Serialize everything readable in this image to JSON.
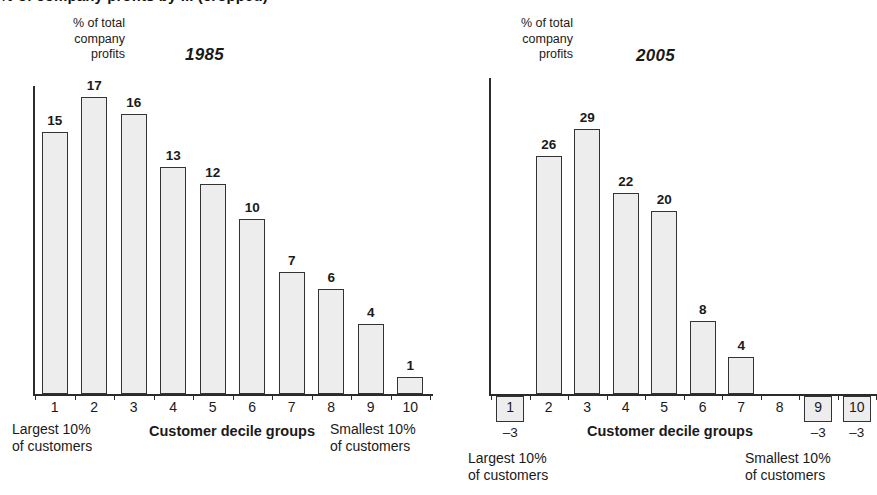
{
  "headline": "% of company profits by ... (cropped)",
  "charts": [
    {
      "id": "1985",
      "title": "1985",
      "y_caption_line1": "% of total",
      "y_caption_line2": "company",
      "y_caption_line3": "profits",
      "x_axis_title": "Customer decile groups",
      "left_note_line1": "Largest 10%",
      "left_note_line2": "of customers",
      "right_note_line1": "Smallest 10%",
      "right_note_line2": "of customers",
      "categories": [
        "1",
        "2",
        "3",
        "4",
        "5",
        "6",
        "7",
        "8",
        "9",
        "10"
      ],
      "values": [
        15,
        17,
        16,
        13,
        12,
        10,
        7,
        6,
        4,
        1
      ],
      "value_labels": [
        "15",
        "17",
        "16",
        "13",
        "12",
        "10",
        "7",
        "6",
        "4",
        "1"
      ]
    },
    {
      "id": "2005",
      "title": "2005",
      "y_caption_line1": "% of total",
      "y_caption_line2": "company",
      "y_caption_line3": "profits",
      "x_axis_title": "Customer decile groups",
      "left_note_line1": "Largest 10%",
      "left_note_line2": "of customers",
      "right_note_line1": "Smallest 10%",
      "right_note_line2": "of customers",
      "categories": [
        "1",
        "2",
        "3",
        "4",
        "5",
        "6",
        "7",
        "8",
        "9",
        "10"
      ],
      "values": [
        -3,
        26,
        29,
        22,
        20,
        8,
        4,
        0,
        -3,
        -3
      ],
      "value_labels": [
        "-3",
        "26",
        "29",
        "22",
        "20",
        "8",
        "4",
        "",
        "-3",
        "-3"
      ],
      "negative_labels": [
        "–3",
        "–3",
        "–3"
      ]
    }
  ],
  "colors": {
    "bar_fill": "#ededed",
    "bar_stroke": "#333333",
    "axis": "#2b2b2b",
    "text": "#1a1a1a",
    "background": "#ffffff"
  },
  "chart_data": [
    {
      "type": "bar",
      "title": "1985",
      "xlabel": "Customer decile groups",
      "ylabel": "% of total company profits",
      "categories": [
        "1",
        "2",
        "3",
        "4",
        "5",
        "6",
        "7",
        "8",
        "9",
        "10"
      ],
      "values": [
        15,
        17,
        16,
        13,
        12,
        10,
        7,
        6,
        4,
        1
      ],
      "ylim": [
        0,
        30
      ],
      "grid": false,
      "legend": "none",
      "annotations": [
        "Largest 10% of customers (decile 1)",
        "Smallest 10% of customers (decile 10)"
      ]
    },
    {
      "type": "bar",
      "title": "2005",
      "xlabel": "Customer decile groups",
      "ylabel": "% of total company profits",
      "categories": [
        "1",
        "2",
        "3",
        "4",
        "5",
        "6",
        "7",
        "8",
        "9",
        "10"
      ],
      "values": [
        -3,
        26,
        29,
        22,
        20,
        8,
        4,
        0,
        -3,
        -3
      ],
      "ylim": [
        -3,
        30
      ],
      "grid": false,
      "legend": "none",
      "annotations": [
        "Largest 10% of customers (decile 1)",
        "Smallest 10% of customers (decile 10)",
        "Deciles 1, 9 and 10 are negative (–3) and drawn as boxed labels below the axis",
        "Decile 8 has no bar (value 0)"
      ]
    }
  ]
}
